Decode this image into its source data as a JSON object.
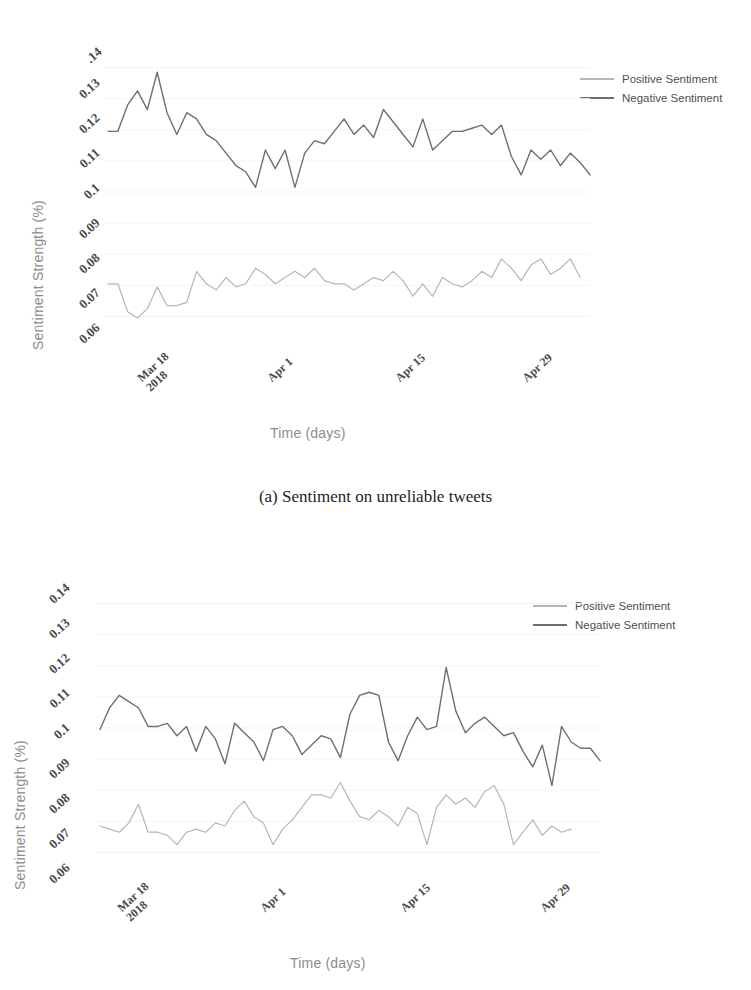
{
  "page": {
    "header_remnant": "",
    "background": "#ffffff"
  },
  "colors": {
    "positive_line": "#b6b6b6",
    "negative_line": "#6f6f6f",
    "axis_label": "#8c8c8c",
    "tick_text": "#4a4a4a",
    "caption_text": "#1d1d1d",
    "gridline": "#f3f3f3"
  },
  "figures": [
    {
      "id": "a",
      "caption": "(a)  Sentiment on unreliable tweets",
      "legend": {
        "position": "top-right",
        "entries": [
          {
            "label": "Positive Sentiment",
            "color": "#b6b6b6"
          },
          {
            "label": "Negative Sentiment",
            "color": "#6f6f6f"
          }
        ]
      },
      "chart_data": {
        "type": "line",
        "title": "",
        "xlabel": "Time (days)",
        "ylabel": "Sentiment Strength (%)",
        "ylim": [
          0.055,
          0.145
        ],
        "yticks": [
          ".14",
          "0.13",
          "0.12",
          "0.11",
          "0.1",
          "0.09",
          "0.08",
          "0.07",
          "0.06"
        ],
        "ytick_values": [
          0.14,
          0.13,
          0.12,
          0.11,
          0.1,
          0.09,
          0.08,
          0.07,
          0.06
        ],
        "xticks": [
          "Mar 18\n2018",
          "Apr 1",
          "Apr 15",
          "Apr 29"
        ],
        "xtick_labels": [
          {
            "line1": "Mar 18",
            "line2": "2018"
          },
          {
            "line1": "Apr 1",
            "line2": ""
          },
          {
            "line1": "Apr 15",
            "line2": ""
          },
          {
            "line1": "Apr 29",
            "line2": ""
          }
        ],
        "xtick_indices": [
          4,
          18,
          32,
          46
        ],
        "grid": true,
        "legend_position": "top-right",
        "x": [
          0,
          1,
          2,
          3,
          4,
          5,
          6,
          7,
          8,
          9,
          10,
          11,
          12,
          13,
          14,
          15,
          16,
          17,
          18,
          19,
          20,
          21,
          22,
          23,
          24,
          25,
          26,
          27,
          28,
          29,
          30,
          31,
          32,
          33,
          34,
          35,
          36,
          37,
          38,
          39,
          40,
          41,
          42,
          43,
          44,
          45,
          46,
          47,
          48,
          49,
          50,
          51,
          52
        ],
        "series": [
          {
            "name": "Negative Sentiment",
            "color": "#6f6f6f",
            "values": [
              0.1195,
              0.1195,
              0.128,
              0.1325,
              0.1265,
              0.1385,
              0.1255,
              0.1185,
              0.1255,
              0.1235,
              0.1185,
              0.1165,
              0.1125,
              0.1085,
              0.1065,
              0.1015,
              0.1135,
              0.1075,
              0.1135,
              0.1015,
              0.1125,
              0.1165,
              0.1155,
              0.1195,
              0.1235,
              0.1185,
              0.1215,
              0.1175,
              0.1265,
              0.1225,
              0.1185,
              0.1145,
              0.1235,
              0.1135,
              0.1165,
              0.1195,
              0.1195,
              0.1205,
              0.1215,
              0.1185,
              0.1215,
              0.1115,
              0.1055,
              0.1135,
              0.1105,
              0.1135,
              0.1085,
              0.1125,
              0.1095,
              0.1055
            ]
          },
          {
            "name": "Positive Sentiment",
            "color": "#b6b6b6",
            "values": [
              0.0705,
              0.0705,
              0.0615,
              0.0595,
              0.0625,
              0.0695,
              0.0635,
              0.0635,
              0.0645,
              0.0745,
              0.0705,
              0.0685,
              0.0725,
              0.0695,
              0.0705,
              0.0755,
              0.0735,
              0.0705,
              0.0725,
              0.0745,
              0.0725,
              0.0755,
              0.0715,
              0.0705,
              0.0705,
              0.0685,
              0.0705,
              0.0725,
              0.0715,
              0.0745,
              0.0715,
              0.0665,
              0.0705,
              0.0665,
              0.0725,
              0.0705,
              0.0695,
              0.0715,
              0.0745,
              0.0725,
              0.0785,
              0.0755,
              0.0715,
              0.0765,
              0.0785,
              0.0735,
              0.0755,
              0.0785,
              0.0725
            ]
          }
        ]
      }
    },
    {
      "id": "b",
      "caption": "",
      "legend": {
        "position": "top-right",
        "entries": [
          {
            "label": "Positive Sentiment",
            "color": "#b6b6b6"
          },
          {
            "label": "Negative Sentiment",
            "color": "#6f6f6f"
          }
        ]
      },
      "chart_data": {
        "type": "line",
        "title": "",
        "xlabel": "Time (days)",
        "ylabel": "Sentiment Strength (%)",
        "ylim": [
          0.055,
          0.145
        ],
        "yticks": [
          "0.14",
          "0.13",
          "0.12",
          "0.11",
          "0.1",
          "0.09",
          "0.08",
          "0.07",
          "0.06"
        ],
        "ytick_values": [
          0.14,
          0.13,
          0.12,
          0.11,
          0.1,
          0.09,
          0.08,
          0.07,
          0.06
        ],
        "xticks": [
          "Mar 18\n2018",
          "Apr 1",
          "Apr 15",
          "Apr 29"
        ],
        "xtick_labels": [
          {
            "line1": "Mar 18",
            "line2": "2018"
          },
          {
            "line1": "Apr 1",
            "line2": ""
          },
          {
            "line1": "Apr 15",
            "line2": ""
          },
          {
            "line1": "Apr 29",
            "line2": ""
          }
        ],
        "xtick_indices": [
          4,
          18,
          32,
          46
        ],
        "grid": true,
        "legend_position": "top-right",
        "x": [
          0,
          1,
          2,
          3,
          4,
          5,
          6,
          7,
          8,
          9,
          10,
          11,
          12,
          13,
          14,
          15,
          16,
          17,
          18,
          19,
          20,
          21,
          22,
          23,
          24,
          25,
          26,
          27,
          28,
          29,
          30,
          31,
          32,
          33,
          34,
          35,
          36,
          37,
          38,
          39,
          40,
          41,
          42,
          43,
          44,
          45,
          46,
          47,
          48,
          49,
          50,
          51,
          52
        ],
        "series": [
          {
            "name": "Negative Sentiment",
            "color": "#6f6f6f",
            "values": [
              0.0995,
              0.1065,
              0.1105,
              0.1085,
              0.1065,
              0.1005,
              0.1005,
              0.1015,
              0.0975,
              0.1005,
              0.0925,
              0.1005,
              0.0965,
              0.0885,
              0.1015,
              0.0985,
              0.0955,
              0.0895,
              0.0995,
              0.1005,
              0.0975,
              0.0915,
              0.0945,
              0.0975,
              0.0965,
              0.0905,
              0.1045,
              0.1105,
              0.1115,
              0.1105,
              0.0955,
              0.0895,
              0.0975,
              0.1035,
              0.0995,
              0.1005,
              0.1195,
              0.1055,
              0.0985,
              0.1015,
              0.1035,
              0.1005,
              0.0975,
              0.0985,
              0.0925,
              0.0875,
              0.0945,
              0.0815,
              0.1005,
              0.0955,
              0.0935,
              0.0935,
              0.0895
            ]
          },
          {
            "name": "Positive Sentiment",
            "color": "#b6b6b6",
            "values": [
              0.0685,
              0.0675,
              0.0665,
              0.0695,
              0.0755,
              0.0665,
              0.0665,
              0.0655,
              0.0625,
              0.0665,
              0.0675,
              0.0665,
              0.0695,
              0.0685,
              0.0735,
              0.0765,
              0.0715,
              0.0695,
              0.0625,
              0.0675,
              0.0705,
              0.0745,
              0.0785,
              0.0785,
              0.0775,
              0.0825,
              0.0765,
              0.0715,
              0.0705,
              0.0735,
              0.0715,
              0.0685,
              0.0745,
              0.0725,
              0.0625,
              0.0745,
              0.0785,
              0.0755,
              0.0775,
              0.0745,
              0.0795,
              0.0815,
              0.0755,
              0.0625,
              0.0665,
              0.0705,
              0.0655,
              0.0685,
              0.0665,
              0.0675
            ]
          }
        ]
      }
    }
  ]
}
